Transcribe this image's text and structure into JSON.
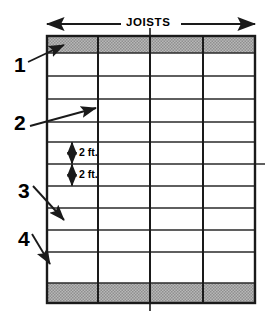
{
  "figure": {
    "title": "JOISTS",
    "type": "engineering-diagram",
    "canvas": {
      "width": 269,
      "height": 313,
      "background": "#ffffff"
    },
    "colors": {
      "line": "#1a1a1a",
      "shaded_band": "#b3b3b3",
      "background": "#ffffff",
      "text": "#000000"
    },
    "header_arrow": {
      "label": "JOISTS",
      "x_start": 47,
      "x_end": 255,
      "y": 24,
      "double_headed": true
    },
    "grid": {
      "x_left": 47,
      "x_right": 255,
      "y_top": 36,
      "y_bottom": 303,
      "column_lines_x": [
        98,
        150,
        203
      ],
      "column_count": 4,
      "row_lines_y": [
        53,
        76,
        99,
        122,
        142,
        164,
        186,
        208,
        230,
        252,
        283
      ],
      "top_band": {
        "y_top": 36,
        "y_bottom": 53,
        "shaded": true
      },
      "bottom_band": {
        "y_top": 283,
        "y_bottom": 303,
        "shaded": true
      },
      "center_tick_top": {
        "x": 150,
        "y_start": 28,
        "y_end": 36
      },
      "center_tick_bottom": {
        "x": 150,
        "y_start": 303,
        "y_end": 311
      },
      "extended_line_right": {
        "y": 164,
        "x_end": 265
      }
    },
    "dimensions": [
      {
        "label": "2 ft.",
        "x": 72,
        "y_top": 142,
        "y_bottom": 164,
        "text_x": 79,
        "text_y": 147
      },
      {
        "label": "2 ft.",
        "x": 72,
        "y_top": 164,
        "y_bottom": 186,
        "text_x": 79,
        "text_y": 169
      }
    ],
    "callouts": [
      {
        "label": "1",
        "text_x": 14,
        "text_y": 54,
        "tail_x": 28,
        "tail_y": 62,
        "head_x": 64,
        "head_y": 45,
        "target": "top-band"
      },
      {
        "label": "2",
        "text_x": 14,
        "text_y": 112,
        "tail_x": 30,
        "tail_y": 126,
        "head_x": 96,
        "head_y": 108,
        "target": "joist-line"
      },
      {
        "label": "3",
        "text_x": 18,
        "text_y": 180,
        "tail_x": 33,
        "tail_y": 186,
        "head_x": 64,
        "head_y": 220,
        "target": "sheathing"
      },
      {
        "label": "4",
        "text_x": 18,
        "text_y": 228,
        "tail_x": 32,
        "tail_y": 234,
        "head_x": 50,
        "head_y": 264,
        "target": "edge-beam"
      }
    ]
  }
}
